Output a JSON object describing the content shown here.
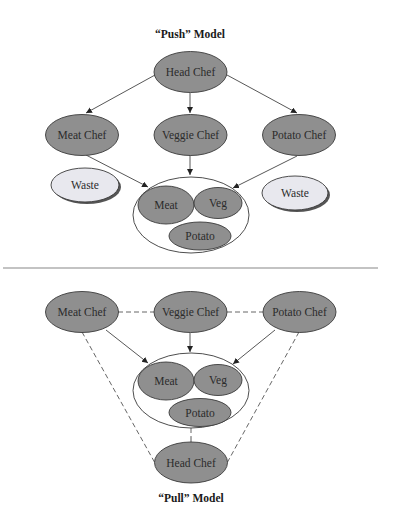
{
  "push": {
    "title": "“Push” Model",
    "head_chef": "Head Chef",
    "meat_chef": "Meat Chef",
    "veggie_chef": "Veggie Chef",
    "potato_chef": "Potato Chef",
    "waste_left": "Waste",
    "waste_right": "Waste",
    "pot": {
      "meat": "Meat",
      "veg": "Veg",
      "potato": "Potato"
    }
  },
  "pull": {
    "title": "“Pull” Model",
    "head_chef": "Head Chef",
    "meat_chef": "Meat Chef",
    "veggie_chef": "Veggie Chef",
    "potato_chef": "Potato Chef",
    "pot": {
      "meat": "Meat",
      "veg": "Veg",
      "potato": "Potato"
    }
  },
  "colors": {
    "node_fill": "#8f8f8f",
    "waste_fill": "#e8e8ee",
    "stroke": "#3a3a3a"
  }
}
